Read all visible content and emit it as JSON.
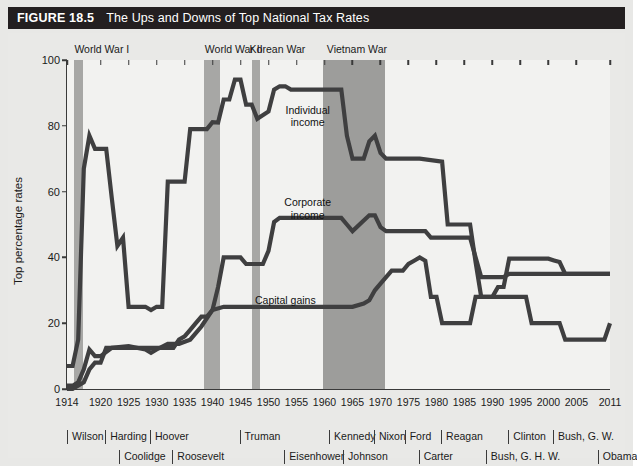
{
  "figure": {
    "number": "FIGURE 18.5",
    "title": "The Ups and Downs of Top National Tax Rates"
  },
  "chart_data": {
    "type": "line",
    "title": "The Ups and Downs of Top National Tax Rates",
    "xlabel": "",
    "ylabel": "Top percentage rates",
    "xlim": [
      1914,
      2011
    ],
    "ylim": [
      0,
      100
    ],
    "grid": false,
    "legend_position": "inline-annotations",
    "yticks": [
      0,
      20,
      40,
      60,
      80,
      100
    ],
    "xticks": [
      1914,
      1920,
      1925,
      1930,
      1935,
      1940,
      1945,
      1950,
      1955,
      1960,
      1965,
      1970,
      1975,
      1980,
      1985,
      1990,
      1995,
      2000,
      2005,
      2011
    ],
    "series": [
      {
        "name": "Individual income",
        "color": "#3f3f40",
        "points": [
          [
            1914,
            7
          ],
          [
            1915,
            7
          ],
          [
            1916,
            15
          ],
          [
            1917,
            67
          ],
          [
            1918,
            77
          ],
          [
            1919,
            73
          ],
          [
            1920,
            73
          ],
          [
            1921,
            73
          ],
          [
            1922,
            58
          ],
          [
            1923,
            43.5
          ],
          [
            1924,
            46
          ],
          [
            1925,
            25
          ],
          [
            1928,
            25
          ],
          [
            1929,
            24
          ],
          [
            1930,
            25
          ],
          [
            1931,
            25
          ],
          [
            1932,
            63
          ],
          [
            1935,
            63
          ],
          [
            1936,
            79
          ],
          [
            1939,
            79
          ],
          [
            1940,
            81.1
          ],
          [
            1941,
            81
          ],
          [
            1942,
            88
          ],
          [
            1943,
            88
          ],
          [
            1944,
            94
          ],
          [
            1945,
            94
          ],
          [
            1946,
            86.45
          ],
          [
            1947,
            86.45
          ],
          [
            1948,
            82.13
          ],
          [
            1950,
            84.36
          ],
          [
            1951,
            91
          ],
          [
            1952,
            92
          ],
          [
            1953,
            92
          ],
          [
            1954,
            91
          ],
          [
            1963,
            91
          ],
          [
            1964,
            77
          ],
          [
            1965,
            70
          ],
          [
            1967,
            70
          ],
          [
            1968,
            75.25
          ],
          [
            1969,
            77
          ],
          [
            1970,
            71.75
          ],
          [
            1971,
            70
          ],
          [
            1976,
            70
          ],
          [
            1977,
            70
          ],
          [
            1981,
            69.125
          ],
          [
            1982,
            50
          ],
          [
            1986,
            50
          ],
          [
            1987,
            38.5
          ],
          [
            1988,
            28
          ],
          [
            1990,
            28
          ],
          [
            1991,
            31
          ],
          [
            1992,
            31
          ],
          [
            1993,
            39.6
          ],
          [
            2000,
            39.6
          ],
          [
            2001,
            39.1
          ],
          [
            2002,
            38.6
          ],
          [
            2003,
            35
          ],
          [
            2011,
            35
          ]
        ]
      },
      {
        "name": "Corporate income",
        "color": "#3f3f40",
        "points": [
          [
            1914,
            1
          ],
          [
            1915,
            1
          ],
          [
            1916,
            2
          ],
          [
            1917,
            6
          ],
          [
            1918,
            12
          ],
          [
            1919,
            10
          ],
          [
            1920,
            10
          ],
          [
            1922,
            12.5
          ],
          [
            1925,
            13
          ],
          [
            1928,
            12
          ],
          [
            1929,
            11
          ],
          [
            1930,
            12
          ],
          [
            1932,
            13.75
          ],
          [
            1934,
            13.75
          ],
          [
            1936,
            15
          ],
          [
            1938,
            19
          ],
          [
            1940,
            24
          ],
          [
            1941,
            31
          ],
          [
            1942,
            40
          ],
          [
            1945,
            40
          ],
          [
            1946,
            38
          ],
          [
            1949,
            38
          ],
          [
            1950,
            42
          ],
          [
            1951,
            50.75
          ],
          [
            1952,
            52
          ],
          [
            1963,
            52
          ],
          [
            1964,
            50
          ],
          [
            1965,
            48
          ],
          [
            1968,
            52.8
          ],
          [
            1969,
            52.8
          ],
          [
            1970,
            49.2
          ],
          [
            1971,
            48
          ],
          [
            1978,
            48
          ],
          [
            1979,
            46
          ],
          [
            1986,
            46
          ],
          [
            1987,
            40
          ],
          [
            1988,
            34
          ],
          [
            1992,
            34
          ],
          [
            1993,
            35
          ],
          [
            2011,
            35
          ]
        ]
      },
      {
        "name": "Capital gains",
        "color": "#3f3f40",
        "points": [
          [
            1914,
            0
          ],
          [
            1915,
            0
          ],
          [
            1917,
            2
          ],
          [
            1918,
            6
          ],
          [
            1919,
            8
          ],
          [
            1920,
            8
          ],
          [
            1921,
            12.5
          ],
          [
            1933,
            12.5
          ],
          [
            1934,
            15
          ],
          [
            1935,
            16
          ],
          [
            1936,
            18
          ],
          [
            1937,
            20
          ],
          [
            1938,
            22
          ],
          [
            1939,
            22
          ],
          [
            1940,
            24
          ],
          [
            1942,
            25
          ],
          [
            1951,
            25
          ],
          [
            1952,
            25
          ],
          [
            1964,
            25
          ],
          [
            1965,
            25
          ],
          [
            1967,
            26
          ],
          [
            1968,
            27
          ],
          [
            1969,
            30
          ],
          [
            1970,
            32
          ],
          [
            1971,
            34
          ],
          [
            1972,
            36
          ],
          [
            1974,
            36
          ],
          [
            1975,
            38
          ],
          [
            1976,
            39
          ],
          [
            1977,
            40
          ],
          [
            1978,
            39
          ],
          [
            1979,
            28
          ],
          [
            1980,
            28
          ],
          [
            1981,
            20
          ],
          [
            1982,
            20
          ],
          [
            1986,
            20
          ],
          [
            1987,
            28
          ],
          [
            1988,
            28
          ],
          [
            1996,
            28
          ],
          [
            1997,
            20
          ],
          [
            2002,
            20
          ],
          [
            2003,
            15
          ],
          [
            2009,
            15
          ],
          [
            2010,
            15
          ],
          [
            2011,
            20
          ]
        ]
      }
    ],
    "annotations": [
      {
        "text": "Individual\nincome",
        "x": 1957,
        "y": 83
      },
      {
        "text": "Corporate\nincome",
        "x": 1957,
        "y": 55
      },
      {
        "text": "Capital gains",
        "x": 1953,
        "y": 27
      }
    ],
    "war_bands": [
      {
        "label": "World War I",
        "start": 1915.2,
        "end": 1916.8,
        "label_x": 1915.5
      },
      {
        "label": "World War II",
        "start": 1938.5,
        "end": 1941.4,
        "label_x": 1938.8
      },
      {
        "label": "Korean War",
        "start": 1947.0,
        "end": 1948.5,
        "label_x": 1946.8
      },
      {
        "label": "Vietnam War",
        "start": 1959.8,
        "end": 1970.8,
        "label_x": 1960.6
      }
    ]
  },
  "axis": {
    "y_label": "Top percentage rates",
    "y_ticks": [
      "100",
      "80",
      "60",
      "40",
      "20",
      "0"
    ],
    "x_ticks": [
      "1914",
      "1920",
      "1925",
      "1930",
      "1935",
      "1940",
      "1945",
      "1950",
      "1955",
      "1960",
      "1965",
      "1970",
      "1975",
      "1980",
      "1985",
      "1990",
      "1995",
      "2000",
      "2005",
      "2011"
    ]
  },
  "wars": [
    {
      "label": "World War I"
    },
    {
      "label": "World War II"
    },
    {
      "label": "Korean War"
    },
    {
      "label": "Vietnam War"
    }
  ],
  "series_labels": [
    {
      "line1": "Individual",
      "line2": "income"
    },
    {
      "line1": "Corporate",
      "line2": "income"
    },
    {
      "line1": "Capital gains",
      "line2": ""
    }
  ],
  "presidents": [
    {
      "name": "Wilson",
      "year": 1914.2,
      "row": 0
    },
    {
      "name": "Harding",
      "year": 1921.0,
      "row": 0
    },
    {
      "name": "Coolidge",
      "year": 1923.5,
      "row": 1
    },
    {
      "name": "Hoover",
      "year": 1929.0,
      "row": 0
    },
    {
      "name": "Roosevelt",
      "year": 1933.0,
      "row": 1
    },
    {
      "name": "Truman",
      "year": 1945.0,
      "row": 0
    },
    {
      "name": "Eisenhower",
      "year": 1953.0,
      "row": 1
    },
    {
      "name": "Kennedy",
      "year": 1961.0,
      "row": 0
    },
    {
      "name": "Johnson",
      "year": 1963.5,
      "row": 1
    },
    {
      "name": "Nixon",
      "year": 1969.0,
      "row": 0
    },
    {
      "name": "Ford",
      "year": 1974.5,
      "row": 0
    },
    {
      "name": "Carter",
      "year": 1977.0,
      "row": 1
    },
    {
      "name": "Reagan",
      "year": 1981.0,
      "row": 0
    },
    {
      "name": "Bush, G. H. W.",
      "year": 1989.0,
      "row": 1
    },
    {
      "name": "Clinton",
      "year": 1993.0,
      "row": 0
    },
    {
      "name": "Bush, G. W.",
      "year": 2001.0,
      "row": 0
    },
    {
      "name": "Obama",
      "year": 2009.0,
      "row": 1
    }
  ]
}
